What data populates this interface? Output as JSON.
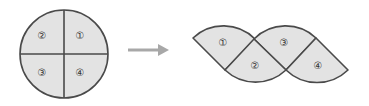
{
  "diagram": {
    "colors": {
      "fill": "#e3e3e3",
      "stroke": "#4a4a4a",
      "arrow": "#a8a8a8"
    },
    "circle": {
      "labels": {
        "top_right": "①",
        "top_left": "②",
        "bottom_left": "③",
        "bottom_right": "④"
      }
    },
    "arrow": {
      "direction": "right"
    },
    "rearranged": {
      "labels": {
        "piece1": "①",
        "piece2": "②",
        "piece3": "③",
        "piece4": "④"
      }
    }
  }
}
